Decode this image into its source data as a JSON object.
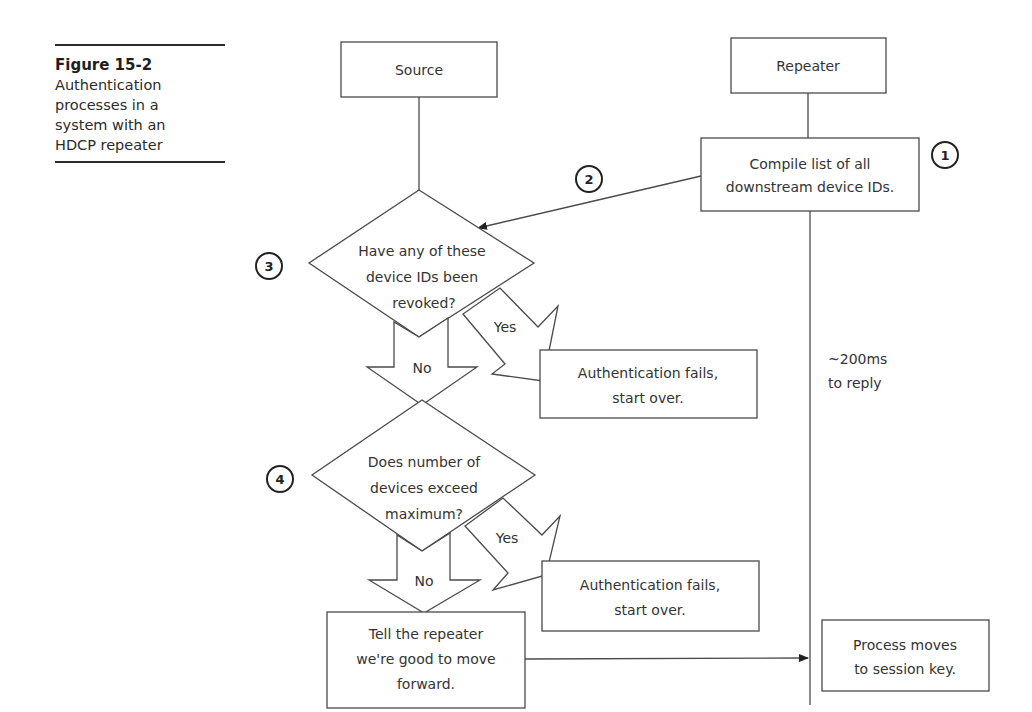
{
  "caption": {
    "figure_number": "Figure 15-2",
    "lines": [
      "Authentication",
      "processes in a",
      "system with an",
      "HDCP repeater"
    ]
  },
  "diagram": {
    "lanes": {
      "source": "Source",
      "repeater": "Repeater"
    },
    "steps": {
      "compile": {
        "badge": "1",
        "lines": [
          "Compile list of all",
          "downstream device IDs."
        ]
      },
      "send": {
        "badge": "2"
      },
      "revoked_check": {
        "badge": "3",
        "lines": [
          "Have any of these",
          "device IDs been",
          "revoked?"
        ],
        "yes": "Yes",
        "no": "No"
      },
      "revoked_fail": {
        "lines": [
          "Authentication fails,",
          "start over."
        ]
      },
      "max_check": {
        "badge": "4",
        "lines": [
          "Does number of",
          "devices exceed",
          "maximum?"
        ],
        "yes": "Yes",
        "no": "No"
      },
      "max_fail": {
        "lines": [
          "Authentication fails,",
          "start over."
        ]
      },
      "tell_repeater": {
        "lines": [
          "Tell the repeater",
          "we're good to move",
          "forward."
        ]
      },
      "session_key": {
        "lines": [
          "Process moves",
          "to session key."
        ]
      }
    },
    "timing_note": {
      "lines": [
        "~200ms",
        "to reply"
      ]
    }
  }
}
